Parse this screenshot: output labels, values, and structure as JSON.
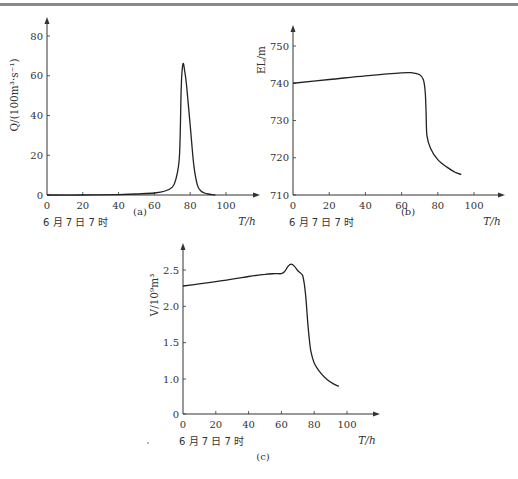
{
  "chart_data": [
    {
      "id": "a",
      "type": "line",
      "caption": "(a)",
      "title": "",
      "ylabel": "Q/(100m³·s⁻¹)",
      "xlabel": "T/h",
      "start_note": "6 月 7 日 7 时",
      "xlim": [
        0,
        110
      ],
      "ylim": [
        0,
        85
      ],
      "xticks": [
        0,
        20,
        40,
        60,
        80,
        100
      ],
      "yticks": [
        0,
        20,
        40,
        60,
        80
      ],
      "grid": false,
      "series": [
        {
          "name": "Q",
          "x": [
            0,
            20,
            40,
            50,
            60,
            66,
            70,
            72,
            74,
            75,
            76,
            77,
            78,
            80,
            82,
            84,
            86,
            88,
            90,
            94
          ],
          "y": [
            0,
            0,
            0.2,
            0.5,
            1,
            2,
            4,
            8,
            20,
            55,
            66,
            62,
            55,
            35,
            15,
            5,
            2,
            1,
            0.5,
            0
          ]
        }
      ]
    },
    {
      "id": "b",
      "type": "line",
      "caption": "(b)",
      "title": "",
      "ylabel": "EL/m",
      "xlabel": "T/h",
      "start_note": "6 月 7 日 7 时",
      "xlim": [
        0,
        110
      ],
      "ylim": [
        710,
        753
      ],
      "xticks": [
        0,
        20,
        40,
        60,
        80,
        100
      ],
      "yticks": [
        710,
        720,
        730,
        740,
        750
      ],
      "grid": false,
      "series": [
        {
          "name": "EL",
          "x": [
            0,
            20,
            40,
            60,
            66,
            70,
            72,
            73,
            73.5,
            74,
            76,
            80,
            85,
            90,
            93
          ],
          "y": [
            740,
            741,
            742,
            742.8,
            742.8,
            742.3,
            741,
            738,
            733,
            726,
            722.5,
            719.5,
            717.5,
            716,
            715.5
          ]
        }
      ]
    },
    {
      "id": "c",
      "type": "line",
      "caption": "(c)",
      "title": "",
      "ylabel": "V/10⁹m³",
      "xlabel": "T/h",
      "start_note": "6 月 7 日 7 时",
      "xlim": [
        0,
        110
      ],
      "ylim": [
        0,
        2.7
      ],
      "xticks": [
        0,
        20,
        40,
        60,
        80,
        100
      ],
      "yticks": [
        0,
        1.0,
        1.5,
        2.0,
        2.5
      ],
      "ytick_labels": [
        "0",
        "1.0",
        "1.5",
        "2.0",
        "2.5"
      ],
      "axis_break": true,
      "grid": false,
      "series": [
        {
          "name": "V",
          "x": [
            0,
            20,
            40,
            50,
            56,
            60,
            62,
            64,
            66,
            68,
            70,
            72,
            73,
            74,
            75,
            76,
            77,
            78,
            80,
            84,
            88,
            92,
            95
          ],
          "y": [
            2.28,
            2.34,
            2.41,
            2.44,
            2.45,
            2.45,
            2.48,
            2.55,
            2.58,
            2.55,
            2.49,
            2.45,
            2.42,
            2.3,
            2.1,
            1.8,
            1.55,
            1.38,
            1.22,
            1.08,
            0.99,
            0.93,
            0.9
          ]
        }
      ]
    }
  ]
}
